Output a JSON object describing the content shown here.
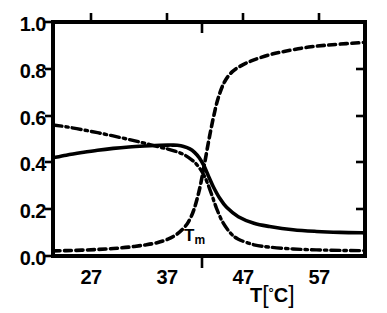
{
  "chart_data": {
    "type": "line",
    "title": "",
    "subtitle": "",
    "xlabel": "T[°C]",
    "ylabel": "",
    "xlim": [
      22.3,
      62.2
    ],
    "ylim": [
      0.0,
      1.0
    ],
    "grid": false,
    "legend": null,
    "x_ticks": [
      27,
      37,
      47,
      57
    ],
    "x_tick_labels": [
      "27",
      "37",
      "47",
      "57"
    ],
    "y_ticks": [
      0.0,
      0.2,
      0.4,
      0.6,
      0.8,
      1.0
    ],
    "y_tick_labels": [
      "0.0",
      "0.2",
      "0.4",
      "0.6",
      "0.8",
      "1.0"
    ],
    "annotations": [
      {
        "text": "Tm",
        "text_main": "T",
        "text_sub": "m",
        "x": 41.6,
        "y": 0.12,
        "marker": "downward tick on bottom axis and on top axis at T = 41.6 °C"
      }
    ],
    "extra_ticks": {
      "bottom_axis_inward_tick_at": 41.6,
      "top_axis_inward_tick_at": 41.6,
      "right_axis_ticks": [
        0.2,
        0.4,
        0.6,
        0.8
      ]
    },
    "series": [
      {
        "name": "dash-dot curve",
        "linestyle": "dashdot",
        "color": "#000000",
        "x": [
          22.3,
          24.0,
          26.0,
          28.0,
          30.0,
          32.0,
          34.0,
          36.0,
          37.0,
          38.0,
          39.0,
          40.0,
          40.6,
          41.2,
          41.6,
          42.0,
          42.6,
          43.2,
          44.0,
          45.0,
          46.0,
          48.0,
          50.0,
          53.0,
          56.0,
          59.0,
          62.2
        ],
        "y": [
          0.56,
          0.552,
          0.54,
          0.527,
          0.513,
          0.498,
          0.482,
          0.465,
          0.457,
          0.447,
          0.434,
          0.412,
          0.394,
          0.368,
          0.345,
          0.316,
          0.262,
          0.205,
          0.145,
          0.098,
          0.072,
          0.048,
          0.038,
          0.03,
          0.026,
          0.024,
          0.023
        ]
      },
      {
        "name": "solid curve",
        "linestyle": "solid",
        "color": "#000000",
        "x": [
          22.3,
          24.0,
          26.0,
          28.0,
          30.0,
          32.0,
          34.0,
          36.0,
          37.0,
          37.6,
          38.2,
          39.0,
          39.8,
          40.4,
          41.0,
          41.6,
          42.2,
          42.8,
          43.6,
          44.5,
          46.0,
          48.0,
          50.0,
          53.0,
          56.0,
          59.0,
          62.2
        ],
        "y": [
          0.42,
          0.431,
          0.442,
          0.452,
          0.46,
          0.466,
          0.47,
          0.473,
          0.474,
          0.474,
          0.473,
          0.468,
          0.458,
          0.443,
          0.42,
          0.386,
          0.34,
          0.296,
          0.248,
          0.208,
          0.168,
          0.14,
          0.126,
          0.112,
          0.105,
          0.101,
          0.099
        ]
      },
      {
        "name": "dashed curve",
        "linestyle": "dashed",
        "color": "#000000",
        "x": [
          22.3,
          24.0,
          26.0,
          28.0,
          30.0,
          32.0,
          34.0,
          35.5,
          37.0,
          38.0,
          38.8,
          39.6,
          40.3,
          41.0,
          41.6,
          42.2,
          42.8,
          43.4,
          44.2,
          45.2,
          46.5,
          48.0,
          50.0,
          52.0,
          55.0,
          58.0,
          62.2
        ],
        "y": [
          0.022,
          0.023,
          0.025,
          0.028,
          0.032,
          0.038,
          0.047,
          0.056,
          0.072,
          0.09,
          0.112,
          0.145,
          0.196,
          0.28,
          0.38,
          0.49,
          0.59,
          0.672,
          0.742,
          0.787,
          0.816,
          0.838,
          0.86,
          0.875,
          0.893,
          0.903,
          0.913
        ]
      }
    ]
  },
  "axes": {
    "x_title": "T[°C]",
    "x_title_parts": {
      "symbol": "T",
      "bracket_open": "[",
      "degree": "°",
      "unit": "C",
      "bracket_close": "]"
    },
    "tm_label": {
      "main": "T",
      "sub": "m"
    },
    "y_labels": [
      "1.0",
      "0.8",
      "0.6",
      "0.4",
      "0.2",
      "0.0"
    ],
    "x_labels": [
      "27",
      "37",
      "47",
      "57"
    ]
  },
  "style": {
    "ink_color": "#000000",
    "background_color": "#ffffff"
  }
}
